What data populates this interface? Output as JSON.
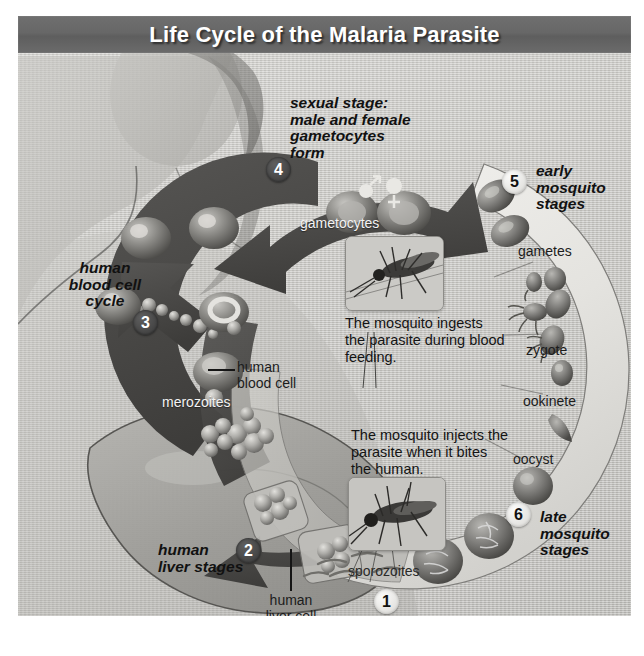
{
  "title": "Life Cycle of the Malaria Parasite",
  "stages": [
    {
      "number": "1",
      "label": "",
      "sublabels": [
        "sporozoites"
      ]
    },
    {
      "number": "2",
      "label": "human\nliver stages",
      "sublabels": [
        "human\nliver cell"
      ]
    },
    {
      "number": "3",
      "label": "human\nblood cell\ncycle",
      "sublabels": [
        "human\nblood cell",
        "merozoites"
      ]
    },
    {
      "number": "4",
      "label": "sexual stage:\nmale and female\ngametocytes\nform",
      "sublabels": [
        "gametocytes"
      ]
    },
    {
      "number": "5",
      "label": "early\nmosquito\nstages",
      "sublabels": [
        "gametes",
        "zygote",
        "ookinete"
      ]
    },
    {
      "number": "6",
      "label": "late\nmosquito\nstages",
      "sublabels": [
        "oocyst"
      ]
    }
  ],
  "stage1": {
    "number": "1",
    "sporozoites": "sporozoites"
  },
  "stage2": {
    "number": "2",
    "line1": "human",
    "line2": "liver stages",
    "cell1": "human",
    "cell2": "liver cell"
  },
  "stage3": {
    "number": "3",
    "line1": "human",
    "line2": "blood cell",
    "line3": "cycle",
    "cell1": "human",
    "cell2": "blood cell",
    "merozoites": "merozoites"
  },
  "stage4": {
    "number": "4",
    "line1": "sexual stage:",
    "line2": "male and female",
    "line3": "gametocytes",
    "line4": "form",
    "gametocytes": "gametocytes"
  },
  "stage5": {
    "number": "5",
    "line1": "early",
    "line2": "mosquito",
    "line3": "stages",
    "gametes": "gametes",
    "zygote": "zygote",
    "ookinete": "ookinete"
  },
  "stage6": {
    "number": "6",
    "line1": "late",
    "line2": "mosquito",
    "line3": "stages",
    "oocyst": "oocyst"
  },
  "callouts": {
    "ingest": {
      "line1": "The mosquito ingests",
      "line2": "the parasite during blood",
      "line3": "feeding."
    },
    "inject": {
      "line1": "The mosquito injects the",
      "line2": "parasite when it bites",
      "line3": "the human."
    }
  },
  "colors": {
    "title_bar": "#676767",
    "title_text": "#ffffff",
    "dark_arrow": "#4a4a4a",
    "light_ring": "#e9e8e4",
    "background": "#c9c8c4",
    "liver": "#9e9d99"
  }
}
